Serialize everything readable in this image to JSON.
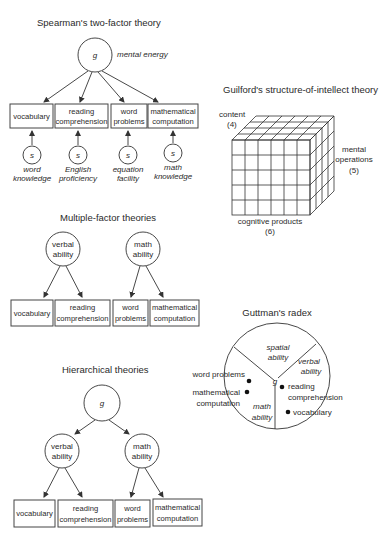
{
  "spearman": {
    "title": "Spearman's two-factor theory",
    "g_label": "g",
    "g_annotation": "mental energy",
    "boxes": [
      {
        "line1": "vocabulary",
        "line2": ""
      },
      {
        "line1": "reading",
        "line2": "comprehension"
      },
      {
        "line1": "word",
        "line2": "problems"
      },
      {
        "line1": "mathematical",
        "line2": "computation"
      }
    ],
    "s_factors": [
      {
        "symbol": "s",
        "line1": "word",
        "line2": "knowledge"
      },
      {
        "symbol": "s",
        "line1": "English",
        "line2": "proficiency"
      },
      {
        "symbol": "s",
        "line1": "equation",
        "line2": "facility"
      },
      {
        "symbol": "s",
        "line1": "math",
        "line2": "knowledge"
      }
    ]
  },
  "guilford": {
    "title": "Guilford's structure-of-intellect theory",
    "content_label": "content",
    "content_count": "(4)",
    "operations_line1": "mental",
    "operations_line2": "operations",
    "operations_count": "(5)",
    "products_label": "cognitive products",
    "products_count": "(6)"
  },
  "multiple_factor": {
    "title": "Multiple-factor theories",
    "factors": [
      {
        "line1": "verbal",
        "line2": "ability"
      },
      {
        "line1": "math",
        "line2": "ability"
      }
    ],
    "boxes": [
      {
        "line1": "vocabulary",
        "line2": ""
      },
      {
        "line1": "reading",
        "line2": "comprehension"
      },
      {
        "line1": "word",
        "line2": "problems"
      },
      {
        "line1": "mathematical",
        "line2": "computation"
      }
    ]
  },
  "guttman": {
    "title": "Guttman's radex",
    "center_label": "g",
    "sectors": [
      {
        "line1": "spatial",
        "line2": "ability"
      },
      {
        "line1": "verbal",
        "line2": "ability"
      },
      {
        "line1": "math",
        "line2": "ability"
      }
    ],
    "points": [
      {
        "line1": "word problems",
        "line2": ""
      },
      {
        "line1": "mathematical",
        "line2": "computation"
      },
      {
        "line1": "reading",
        "line2": "comprehension"
      },
      {
        "line1": "vocabulary",
        "line2": ""
      }
    ]
  },
  "hierarchical": {
    "title": "Hierarchical theories",
    "g_label": "g",
    "factors": [
      {
        "line1": "verbal",
        "line2": "ability"
      },
      {
        "line1": "math",
        "line2": "ability"
      }
    ],
    "boxes": [
      {
        "line1": "vocabulary",
        "line2": ""
      },
      {
        "line1": "reading",
        "line2": "comprehension"
      },
      {
        "line1": "word",
        "line2": "problems"
      },
      {
        "line1": "mathematical",
        "line2": "computation"
      }
    ]
  }
}
